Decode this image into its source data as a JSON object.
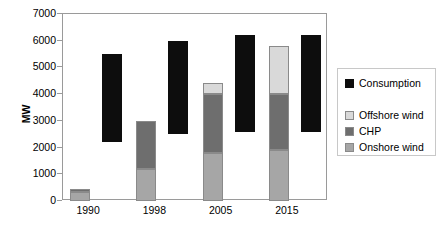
{
  "chart_data": {
    "type": "bar",
    "title": "",
    "subtitle": "",
    "xlabel": "",
    "ylabel": "MW",
    "categories": [
      "1990",
      "1998",
      "2005",
      "2015"
    ],
    "ylim": [
      0,
      7000
    ],
    "yticks": [
      0,
      1000,
      2000,
      3000,
      4000,
      5000,
      6000,
      7000
    ],
    "ytick_labels": [
      "0",
      "1000",
      "2000",
      "3000",
      "4000",
      "5000",
      "6000",
      "7000"
    ],
    "grid": false,
    "legend_position": "right",
    "series": [
      {
        "name": "Onshore wind",
        "stack": "capacity",
        "color": "#a6a6a6",
        "values": [
          330,
          1200,
          1800,
          1900
        ]
      },
      {
        "name": "CHP",
        "stack": "capacity",
        "color": "#6e6e6e",
        "values": [
          130,
          1800,
          2200,
          2100
        ]
      },
      {
        "name": "Offshore wind",
        "stack": "capacity",
        "color": "#d9d9d9",
        "values": [
          0,
          0,
          400,
          1800
        ]
      },
      {
        "name": "Consumption",
        "stack": "range",
        "color": "#0d0d0d",
        "ranges": [
          {
            "min": 2200,
            "max": 5500
          },
          {
            "min": 2500,
            "max": 6000
          },
          {
            "min": 2600,
            "max": 6200
          },
          {
            "min": 2600,
            "max": 6200
          }
        ]
      }
    ],
    "capacity_totals": [
      460,
      3000,
      4400,
      5800
    ]
  },
  "legend": {
    "items": [
      {
        "label": "Consumption",
        "color": "#0d0d0d"
      },
      {
        "label": "Offshore wind",
        "color": "#d9d9d9"
      },
      {
        "label": "CHP",
        "color": "#6e6e6e"
      },
      {
        "label": "Onshore wind",
        "color": "#a6a6a6"
      }
    ]
  }
}
